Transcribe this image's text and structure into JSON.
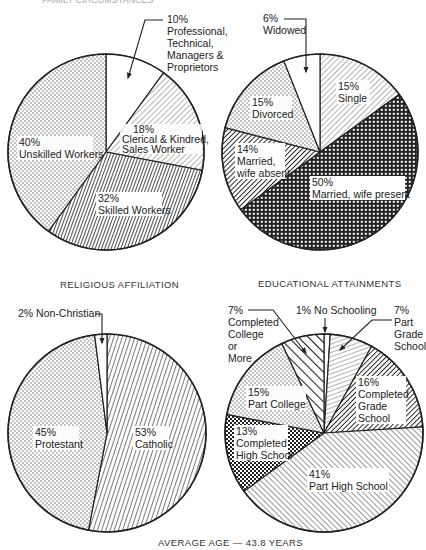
{
  "header": {
    "cut_off_title": "FAMILY CIRCUMSTANCES"
  },
  "chart_data": [
    {
      "type": "pie",
      "title": "",
      "name": "occupation",
      "start_angle_deg": 0,
      "direction": "clockwise",
      "slices": [
        {
          "label": "Professional, Technical, Managers & Proprietors",
          "value": 10,
          "label_lines": [
            "10%",
            "Professional,",
            "Technical,",
            "Managers &",
            "Proprietors"
          ],
          "pattern": "white"
        },
        {
          "label": "Clerical & Kindred, Sales Worker",
          "value": 18,
          "label_lines": [
            "18%",
            "Clerical & Kindred,",
            "Sales Worker"
          ],
          "pattern": "light-diagonal"
        },
        {
          "label": "Skilled Workers",
          "value": 32,
          "label_lines": [
            "32%",
            "Skilled Workers"
          ],
          "pattern": "dense-steep-hatch"
        },
        {
          "label": "Unskilled Workers",
          "value": 40,
          "label_lines": [
            "40%",
            "Unskilled Workers"
          ],
          "pattern": "dots"
        }
      ]
    },
    {
      "type": "pie",
      "title": "",
      "name": "marital-status",
      "start_angle_deg": 0,
      "direction": "clockwise",
      "slices": [
        {
          "label": "Single",
          "value": 15,
          "label_lines": [
            "15%",
            "Single"
          ],
          "pattern": "light-diagonal"
        },
        {
          "label": "Married, wife present",
          "value": 50,
          "label_lines": [
            "50%",
            "Married, wife present"
          ],
          "pattern": "crosshatch"
        },
        {
          "label": "Married, wife absent",
          "value": 14,
          "label_lines": [
            "14%",
            "Married,",
            "wife absent"
          ],
          "pattern": "dark-diagonal"
        },
        {
          "label": "Divorced",
          "value": 15,
          "label_lines": [
            "15%",
            "Divorced"
          ],
          "pattern": "dots"
        },
        {
          "label": "Widowed",
          "value": 6,
          "label_lines": [
            "6%",
            "Widowed"
          ],
          "pattern": "white"
        }
      ]
    },
    {
      "type": "pie",
      "title": "RELIGIOUS AFFILIATION",
      "name": "religious-affiliation",
      "start_angle_deg": 0,
      "direction": "clockwise",
      "slices": [
        {
          "label": "Catholic",
          "value": 53,
          "label_lines": [
            "53%",
            "Catholic"
          ],
          "pattern": "steep-hatch"
        },
        {
          "label": "Protestant",
          "value": 45,
          "label_lines": [
            "45%",
            "Protestant"
          ],
          "pattern": "dots"
        },
        {
          "label": "Non-Christian",
          "value": 2,
          "label_lines": [
            "2% Non-Christian"
          ],
          "pattern": "white"
        }
      ]
    },
    {
      "type": "pie",
      "title": "EDUCATIONAL ATTAINMENTS",
      "name": "educational-attainments",
      "start_angle_deg": 0,
      "direction": "clockwise",
      "slices": [
        {
          "label": "No Schooling",
          "value": 1,
          "label_lines": [
            "1% No Schooling"
          ],
          "pattern": "white"
        },
        {
          "label": "Part Grade School",
          "value": 7,
          "label_lines": [
            "7%",
            "Part",
            "Grade",
            "School"
          ],
          "pattern": "shallow-lines"
        },
        {
          "label": "Completed Grade School",
          "value": 16,
          "label_lines": [
            "16%",
            "Completed",
            "Grade",
            "School"
          ],
          "pattern": "dark-diagonal"
        },
        {
          "label": "Part High School",
          "value": 41,
          "label_lines": [
            "41%",
            "Part High School"
          ],
          "pattern": "forward-diagonal"
        },
        {
          "label": "Completed High School",
          "value": 13,
          "label_lines": [
            "13%",
            "Completed",
            "High School"
          ],
          "pattern": "checker-dots"
        },
        {
          "label": "Part College",
          "value": 15,
          "label_lines": [
            "15%",
            "Part College"
          ],
          "pattern": "dots"
        },
        {
          "label": "Completed College or More",
          "value": 7,
          "label_lines": [
            "7%",
            "Completed",
            "College",
            "or",
            "More"
          ],
          "pattern": "bold-diagonal"
        }
      ]
    }
  ],
  "labels": {
    "p1": {
      "prof": [
        "10%",
        "Professional,",
        "Technical,",
        "Managers &",
        "Proprietors"
      ],
      "cler": [
        "18%",
        "Clerical & Kindred,",
        "Sales Worker"
      ],
      "skil": [
        "32%",
        "Skilled Workers"
      ],
      "unsk": [
        "40%",
        "Unskilled Workers"
      ]
    },
    "p2": {
      "wid": [
        "6%",
        "Widowed"
      ],
      "sing": [
        "15%",
        "Single"
      ],
      "div": [
        "15%",
        "Divorced"
      ],
      "abs": [
        "14%",
        "Married,",
        "wife absent"
      ],
      "pres": [
        "50%",
        "Married, wife present"
      ]
    },
    "p3": {
      "title": "RELIGIOUS AFFILIATION",
      "nonc": "2% Non-Christian",
      "prot": [
        "45%",
        "Protestant"
      ],
      "cath": [
        "53%",
        "Catholic"
      ]
    },
    "p4": {
      "title": "EDUCATIONAL ATTAINMENTS",
      "none": "1% No Schooling",
      "ccol": [
        "7%",
        "Completed",
        "College",
        "or",
        "More"
      ],
      "pgs": [
        "7%",
        "Part",
        "Grade",
        "School"
      ],
      "pcol": [
        "15%",
        "Part College"
      ],
      "cgs": [
        "16%",
        "Completed",
        "Grade",
        "School"
      ],
      "chs": [
        "13%",
        "Completed",
        "High School"
      ],
      "phs": [
        "41%",
        "Part High School"
      ]
    }
  },
  "footer": {
    "caption": "AVERAGE AGE — 43.8 YEARS"
  }
}
